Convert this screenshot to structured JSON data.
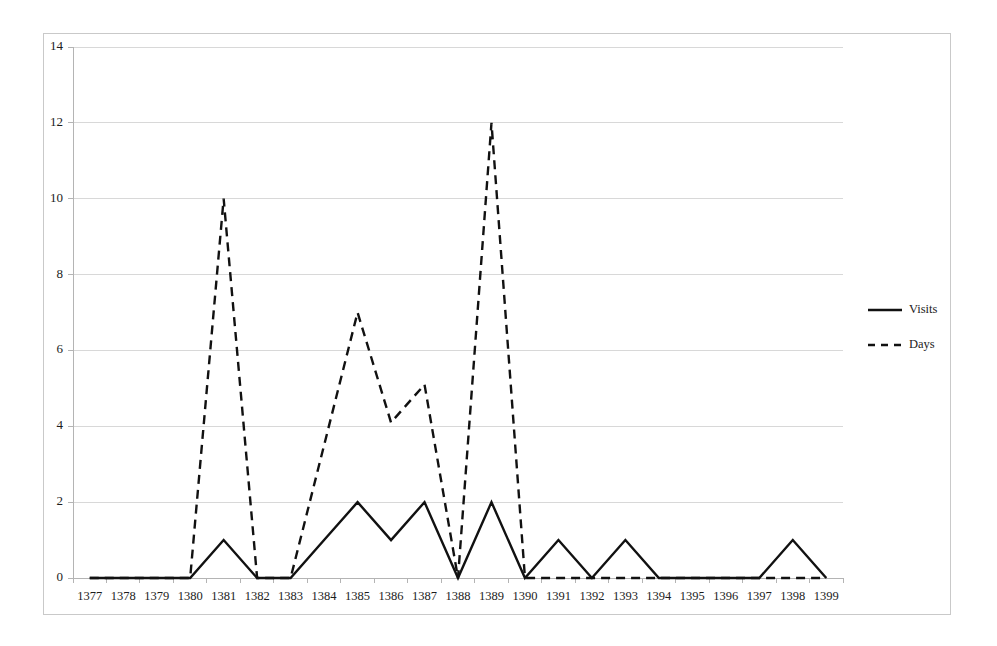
{
  "chart_data": {
    "type": "line",
    "title": "",
    "subtitle": "",
    "xlabel": "",
    "ylabel": "",
    "categories": [
      "1377",
      "1378",
      "1379",
      "1380",
      "1381",
      "1382",
      "1383",
      "1384",
      "1385",
      "1386",
      "1387",
      "1388",
      "1389",
      "1390",
      "1391",
      "1392",
      "1393",
      "1394",
      "1395",
      "1396",
      "1397",
      "1398",
      "1399"
    ],
    "series": [
      {
        "name": "Visits",
        "style": "solid",
        "color": "#111111",
        "values": [
          0,
          0,
          0,
          0,
          1,
          0,
          0,
          1,
          2,
          1,
          2,
          0,
          2,
          0,
          1,
          0,
          1,
          0,
          0,
          0,
          0,
          1,
          0
        ]
      },
      {
        "name": "Days",
        "style": "dashed",
        "color": "#111111",
        "values": [
          0,
          0,
          0,
          0,
          10,
          0,
          0,
          3.5,
          7,
          4.1,
          5.1,
          0,
          12,
          0,
          0,
          0,
          0,
          0,
          0,
          0,
          0,
          0,
          0
        ]
      }
    ],
    "ylim": [
      0,
      14
    ],
    "ytick_values": [
      0,
      2,
      4,
      6,
      8,
      10,
      12,
      14
    ],
    "ytick_labels": [
      "0",
      "2",
      "4",
      "6",
      "8",
      "10",
      "12",
      "14"
    ],
    "grid": true,
    "grid_axis": "y",
    "grid_color": "#d8d8d8",
    "legend_position": "right",
    "legend_entries": [
      "Visits",
      "Days"
    ],
    "background_color": "#ffffff",
    "frame_color": "#c9c9c9"
  },
  "legend": {
    "items": [
      {
        "label": "Visits",
        "style": "solid"
      },
      {
        "label": "Days",
        "style": "dashed"
      }
    ]
  },
  "axes": {
    "y": {
      "labels": [
        "14",
        "12",
        "10",
        "8",
        "6",
        "4",
        "2",
        "0"
      ]
    },
    "x": {
      "labels": [
        "1377",
        "1378",
        "1379",
        "1380",
        "1381",
        "1382",
        "1383",
        "1384",
        "1385",
        "1386",
        "1387",
        "1388",
        "1389",
        "1394",
        "1395",
        "1396",
        "1397",
        "1398",
        "1399"
      ]
    }
  }
}
